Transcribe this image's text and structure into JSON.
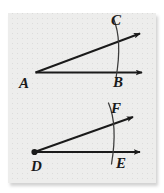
{
  "figure": {
    "background_color": "#ededec",
    "page_color": "#ffffff",
    "ink_color": "#1a1a1a",
    "caption": "",
    "diagrams": [
      {
        "name": "upper-angle",
        "vertex_label": "A",
        "ray_end_labels": [
          "C",
          "B"
        ],
        "vertex_dot": false,
        "arc": true,
        "arc_description": "single arc crossing both rays",
        "angle_degrees": 20
      },
      {
        "name": "lower-angle",
        "vertex_label": "D",
        "ray_end_labels": [
          "F",
          "E"
        ],
        "vertex_dot": true,
        "arc": true,
        "arc_description": "single arc crossing both rays",
        "angle_degrees": 20
      }
    ],
    "labels": {
      "a": "A",
      "b": "B",
      "c": "C",
      "d": "D",
      "e": "E",
      "f": "F"
    }
  }
}
